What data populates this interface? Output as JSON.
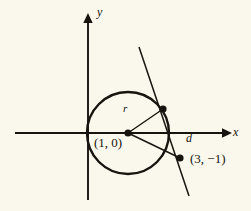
{
  "figure": {
    "background_color": "#faf7ec",
    "ink_color": "#17140f"
  },
  "axes": {
    "x_label": "x",
    "y_label": "y",
    "x_axis": {
      "x1": 15,
      "y1": 133,
      "x2": 228,
      "y2": 133
    },
    "y_axis": {
      "x1": 88,
      "y1": 200,
      "x2": 88,
      "y2": 13
    }
  },
  "circle": {
    "center_px": {
      "x": 128,
      "y": 133
    },
    "radius_px": 41,
    "center_label": "(1, 0)"
  },
  "points": [
    {
      "name": "center",
      "label": "(1, 0)",
      "px": {
        "x": 128,
        "y": 133
      },
      "marker": "filled-dot"
    },
    {
      "name": "tangency-point",
      "label": "",
      "px": {
        "x": 163,
        "y": 109
      },
      "marker": "filled-dot"
    },
    {
      "name": "external-point",
      "label": "(3, -1)",
      "px": {
        "x": 180,
        "y": 158
      },
      "marker": "filled-dot"
    }
  ],
  "segments": [
    {
      "name": "radius",
      "label": "r",
      "from_px": {
        "x": 128,
        "y": 133
      },
      "to_px": {
        "x": 163,
        "y": 109
      }
    },
    {
      "name": "distance",
      "label": "d",
      "from_px": {
        "x": 128,
        "y": 133
      },
      "to_px": {
        "x": 180,
        "y": 158
      }
    }
  ],
  "tangent_line": {
    "name": "tangent-line",
    "from_px": {
      "x": 139,
      "y": 47
    },
    "to_px": {
      "x": 189,
      "y": 196
    }
  },
  "labels": {
    "y": "y",
    "x": "x",
    "r": "r",
    "d": "d",
    "center": "(1, 0)",
    "external": "(3, −1)"
  }
}
